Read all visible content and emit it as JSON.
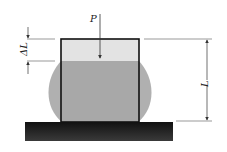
{
  "diagram": {
    "labels": {
      "force": "P",
      "delta_length": "ΔL",
      "length": "L"
    },
    "colors": {
      "specimen_top": "#e2e2e2",
      "specimen_body": "#a9a9a9",
      "bulge": "#b3b3b3",
      "base": "#1e1e1e",
      "outline": "#111111",
      "dimension_line": "#444444"
    }
  }
}
